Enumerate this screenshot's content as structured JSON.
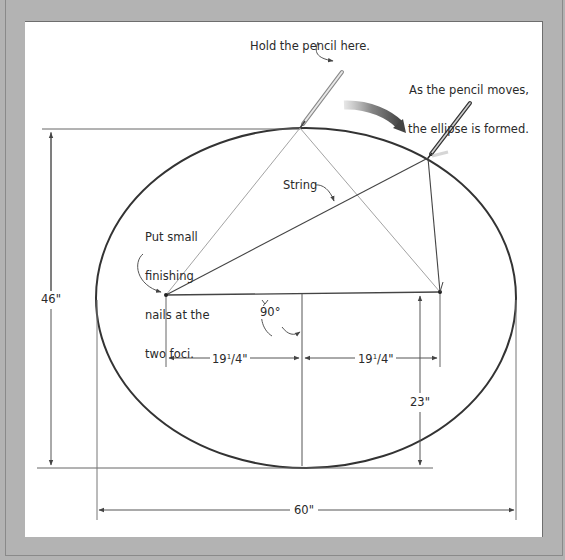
{
  "labels": {
    "hold_pencil": "Hold the pencil here.",
    "pencil_moves_line1": "As the pencil moves,",
    "pencil_moves_line2": "the ellipse is formed.",
    "string": "String",
    "nails_line1": "Put small",
    "nails_line2": "finishing",
    "nails_line3": "nails at the",
    "nails_line4": "two foci.",
    "angle": "90°"
  },
  "dimensions": {
    "height_total": "46\"",
    "width_total": "60\"",
    "half_height": "23\"",
    "focus_left_whole": "19",
    "focus_left_num": "1",
    "focus_left_den": "/4\"",
    "focus_right_whole": "19",
    "focus_right_num": "1",
    "focus_right_den": "/4\""
  },
  "colors": {
    "frame": "#b3b3b3",
    "panel": "#ffffff",
    "ellipse": "#333333",
    "lines": "#555555",
    "text": "#2a2a2a"
  }
}
